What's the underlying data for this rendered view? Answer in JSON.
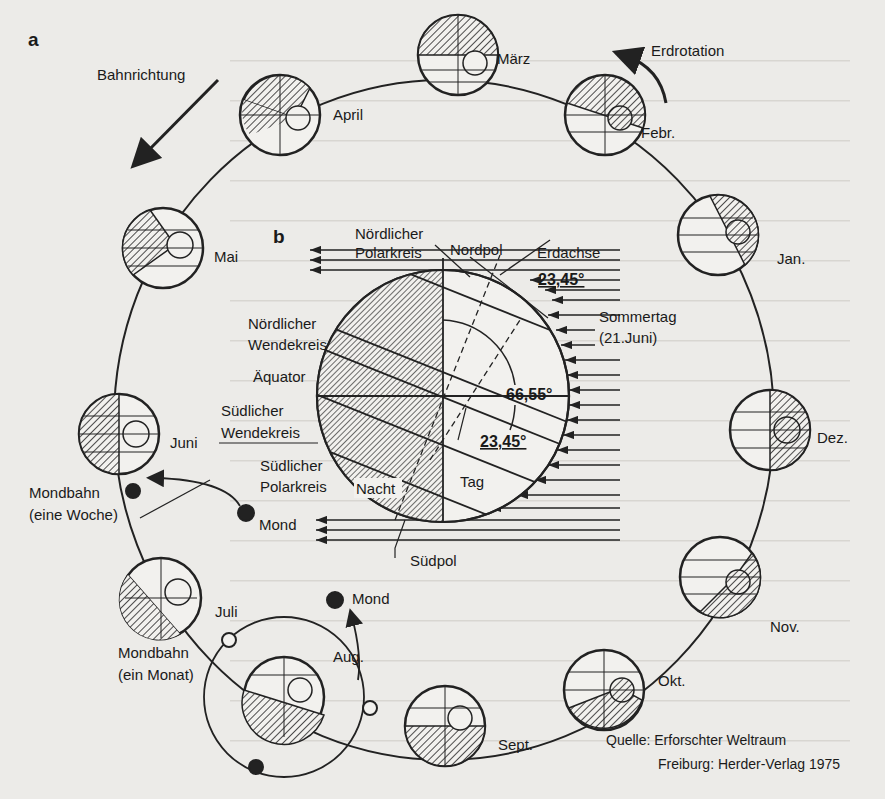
{
  "panel_a": {
    "label": "a",
    "orbit_direction_label": "Bahnrichtung",
    "rotation_label": "Erdrotation",
    "months": [
      {
        "name": "März",
        "x": 458,
        "y": 55,
        "lx": 497,
        "ly": 64
      },
      {
        "name": "Febr.",
        "x": 605,
        "y": 115,
        "lx": 641,
        "ly": 138
      },
      {
        "name": "Jan.",
        "x": 718,
        "y": 235,
        "lx": 777,
        "ly": 264
      },
      {
        "name": "Dez.",
        "x": 770,
        "y": 430,
        "lx": 817,
        "ly": 443
      },
      {
        "name": "Nov.",
        "x": 720,
        "y": 577,
        "lx": 770,
        "ly": 632
      },
      {
        "name": "Okt.",
        "x": 604,
        "y": 690,
        "lx": 658,
        "ly": 686
      },
      {
        "name": "Sept.",
        "x": 445,
        "y": 726,
        "lx": 498,
        "ly": 750
      },
      {
        "name": "Aug.",
        "x": 284,
        "y": 697,
        "lx": 333,
        "ly": 662
      },
      {
        "name": "Juli",
        "x": 161,
        "y": 598,
        "lx": 215,
        "ly": 617
      },
      {
        "name": "Juni",
        "x": 119,
        "y": 434,
        "lx": 170,
        "ly": 448
      },
      {
        "name": "Mai",
        "x": 163,
        "y": 248,
        "lx": 214,
        "ly": 262
      },
      {
        "name": "April",
        "x": 280,
        "y": 115,
        "lx": 333,
        "ly": 120
      }
    ],
    "moon_orbit_week": {
      "label_line1": "Mondbahn",
      "label_line2": "(eine Woche)",
      "moon_label": "Mond"
    },
    "moon_orbit_month": {
      "label_line1": "Mondbahn",
      "label_line2": "(ein Monat)",
      "moon_label": "Mond"
    }
  },
  "panel_b": {
    "label": "b",
    "labels": {
      "arctic_circle_1": "Nördlicher",
      "arctic_circle_2": "Polarkreis",
      "north_pole": "Nordpol",
      "earth_axis": "Erdachse",
      "tropic_cancer_1": "Nördlicher",
      "tropic_cancer_2": "Wendekreis",
      "equator": "Äquator",
      "tropic_capricorn_1": "Südlicher",
      "tropic_capricorn_2": "Wendekreis",
      "night": "Nacht",
      "day": "Tag",
      "antarctic_circle_1": "Südlicher",
      "antarctic_circle_2": "Polarkreis",
      "south_pole": "Südpol",
      "summer_day_1": "Sommertag",
      "summer_day_2": "(21.Juni)"
    },
    "angles": {
      "axial_tilt_top": "23,45°",
      "complement": "66,55°",
      "axial_tilt_bottom": "23,45°"
    }
  },
  "source": {
    "line1": "Quelle: Erforschter Weltraum",
    "line2": "Freiburg: Herder-Verlag 1975"
  }
}
